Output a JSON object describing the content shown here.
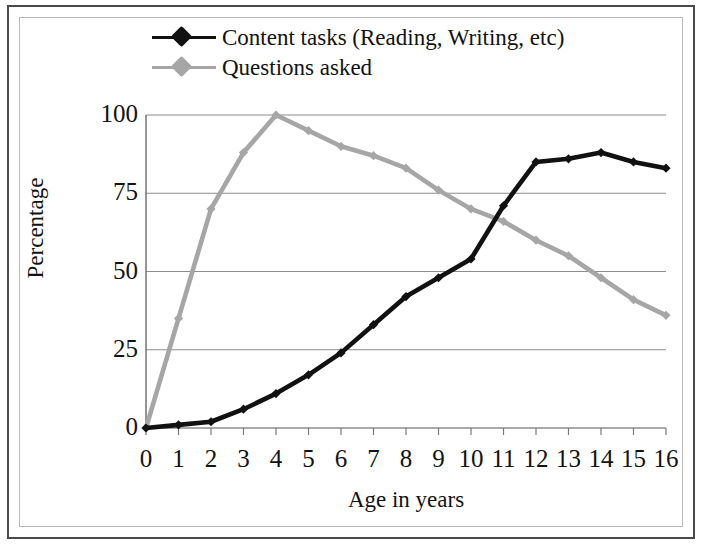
{
  "chart_data": {
    "type": "line",
    "title": "",
    "xlabel": "Age in years",
    "ylabel": "Percentage",
    "xlim": [
      0,
      16
    ],
    "ylim": [
      0,
      100
    ],
    "grid": true,
    "legend_position": "top",
    "x": [
      0,
      1,
      2,
      3,
      4,
      5,
      6,
      7,
      8,
      9,
      10,
      11,
      12,
      13,
      14,
      15,
      16
    ],
    "xticklabels": [
      "0",
      "1",
      "2",
      "3",
      "4",
      "5",
      "6",
      "7",
      "8",
      "9",
      "10",
      "11",
      "12",
      "13",
      "14",
      "15",
      "16"
    ],
    "yticks": [
      0,
      25,
      50,
      75,
      100
    ],
    "yticklabels": [
      "0",
      "25",
      "50",
      "75",
      "100"
    ],
    "series": [
      {
        "name": "Content tasks (Reading, Writing, etc)",
        "color": "#111111",
        "marker": "diamond",
        "values": [
          0,
          1,
          2,
          6,
          11,
          17,
          24,
          33,
          42,
          48,
          54,
          71,
          85,
          86,
          88,
          85,
          83
        ]
      },
      {
        "name": "Questions asked",
        "color": "#a6a6a6",
        "marker": "diamond",
        "values": [
          0,
          35,
          70,
          88,
          100,
          95,
          90,
          87,
          83,
          76,
          70,
          66,
          60,
          55,
          48,
          41,
          36
        ]
      }
    ]
  },
  "legend": {
    "items": [
      {
        "label": "Content tasks (Reading, Writing, etc)",
        "color": "#111111"
      },
      {
        "label": "Questions asked",
        "color": "#a6a6a6"
      }
    ]
  },
  "axes": {
    "x_title": "Age in years",
    "y_title": "Percentage"
  },
  "colors": {
    "series_content_tasks": "#111111",
    "series_questions_asked": "#a6a6a6",
    "gridline": "#8c8c8c",
    "axis": "#7a7a7a",
    "outer_border": "#4a4a4a",
    "inner_border": "#b8b8b8",
    "background": "#ffffff"
  }
}
